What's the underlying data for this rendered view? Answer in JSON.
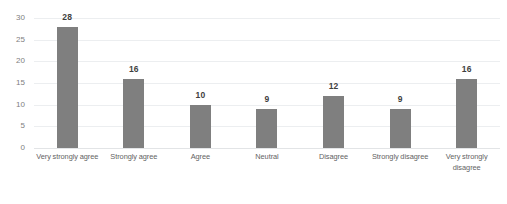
{
  "chart_data": {
    "type": "bar",
    "title": "",
    "subtitle": "",
    "xlabel": "",
    "ylabel": "",
    "categories": [
      "Very strongly agree",
      "Strongly agree",
      "Agree",
      "Neutral",
      "Disagree",
      "Strongly disagree",
      "Very strongly disagree"
    ],
    "values": [
      28,
      16,
      10,
      9,
      12,
      9,
      16
    ],
    "value_labels": [
      "28",
      "16",
      "10",
      "9",
      "12",
      "9",
      "16"
    ],
    "ylim": [
      0,
      30
    ],
    "ytick_labels": [
      "30",
      "25",
      "20",
      "15",
      "10",
      "5",
      "0"
    ],
    "ytick_values": [
      30,
      25,
      20,
      15,
      10,
      5,
      0
    ],
    "grid": true,
    "grid_orientation": "horizontal",
    "legend": false,
    "legend_position": "none",
    "bar_color": "#7f7f7f",
    "gridline_color": "#eceef0",
    "label_color": "#636363",
    "value_label_color": "#3f3f3f",
    "axis_label_color": "#808080",
    "background_color": "#ffffff"
  }
}
